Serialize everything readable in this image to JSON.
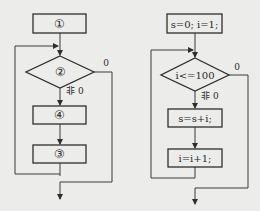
{
  "left_flowchart": {
    "box1": "①",
    "condition": "②",
    "true_label": "非 0",
    "false_label": "0",
    "box_body": "④",
    "box_step": "③"
  },
  "right_flowchart": {
    "init": "s=0; i=1;",
    "condition": "i<=100",
    "true_label": "非 0",
    "false_label": "0",
    "body": "s=s+i;",
    "step": "i=i+1;"
  }
}
